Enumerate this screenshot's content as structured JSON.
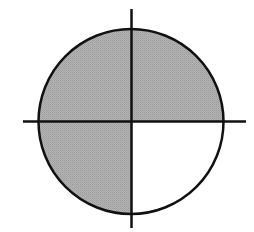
{
  "diagram": {
    "type": "quadrant-circle",
    "center": {
      "x": 131,
      "y": 121.5
    },
    "radius": 92.5,
    "axes": {
      "horizontal": {
        "x1": 23,
        "x2": 246,
        "y": 121.5
      },
      "vertical": {
        "x": 131.5,
        "y1": 9,
        "y2": 228
      }
    },
    "quadrants": [
      {
        "name": "top-left",
        "shaded": true
      },
      {
        "name": "top-right",
        "shaded": true
      },
      {
        "name": "bottom-left",
        "shaded": true
      },
      {
        "name": "bottom-right",
        "shaded": false
      }
    ],
    "colors": {
      "shade": "#ababab",
      "unshaded": "#ffffff",
      "stroke": "#111111",
      "background": "#ffffff"
    },
    "shaded_fraction": "3/4"
  }
}
